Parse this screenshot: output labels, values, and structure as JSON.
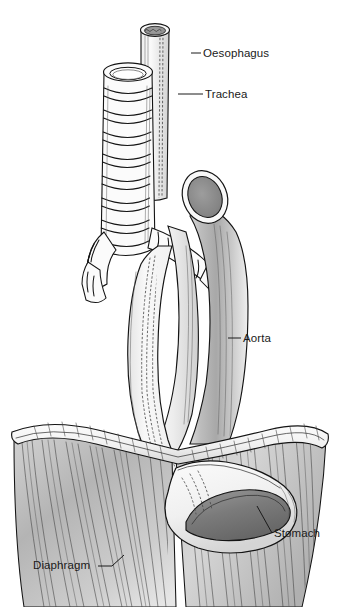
{
  "figure": {
    "background_color": "#ffffff",
    "ink_color": "#141414",
    "label_color": "#1a1a1a",
    "width": 338,
    "height": 607
  },
  "labels": [
    {
      "id": "oesophagus",
      "text": "Oesophagus",
      "text_x": 203,
      "text_y": 57,
      "leader_x1": 191,
      "leader_y1": 53,
      "leader_x2": 201,
      "leader_y2": 53
    },
    {
      "id": "trachea",
      "text": "Trachea",
      "text_x": 205,
      "text_y": 98,
      "leader_x1": 178,
      "leader_y1": 94,
      "leader_x2": 203,
      "leader_y2": 94
    },
    {
      "id": "aorta",
      "text": "Aorta",
      "text_x": 243,
      "text_y": 342,
      "leader_x1": 228,
      "leader_y1": 338,
      "leader_x2": 241,
      "leader_y2": 338
    },
    {
      "id": "stomach",
      "text": "Stomach",
      "text_x": 274,
      "text_y": 537,
      "leader_x1": 257,
      "leader_y1": 506,
      "leader_x2": 272,
      "leader_y2": 533
    },
    {
      "id": "diaphragm",
      "text": "Diaphragm",
      "text_x": 33,
      "text_y": 569,
      "leader_x1": 98,
      "leader_y1": 566,
      "leader_x2": 124,
      "leader_y2": 555
    }
  ],
  "structures": {
    "oesophagus": {
      "name": "Oesophagus",
      "description": "Muscular tube running from upper cut end, behind trachea, down through diaphragm hiatus into stomach",
      "lumen_fill": "#8f8f8f",
      "wall_fill": "#f3f3f3",
      "texture": "longitudinal stipple lines"
    },
    "trachea": {
      "name": "Trachea",
      "description": "Cartilage-ringed airway anterior to oesophagus, bifurcating into two bronchi",
      "ring_count": 11,
      "fill": "#fbfbfb",
      "bronchi": 2
    },
    "aorta": {
      "name": "Aorta",
      "description": "Arch with cut cross-section at upper left, descending behind to pass through diaphragm",
      "lumen_fill": "#8a8a8a",
      "wall_fill": "#e8e8e8",
      "shading": "graded gray"
    },
    "stomach": {
      "name": "Stomach",
      "description": "Cardia and fundus lying under right dome of diaphragm, lumen opening shown dark gray",
      "lumen_fill": "#777777",
      "wall_fill": "#f5f5f5"
    },
    "diaphragm": {
      "name": "Diaphragm",
      "description": "Wide funnel-shaped muscular sheet with rolled rim and radiating muscle fibres",
      "fill": "#e3e3e3",
      "fiber_style": "radiating hairlines"
    }
  }
}
